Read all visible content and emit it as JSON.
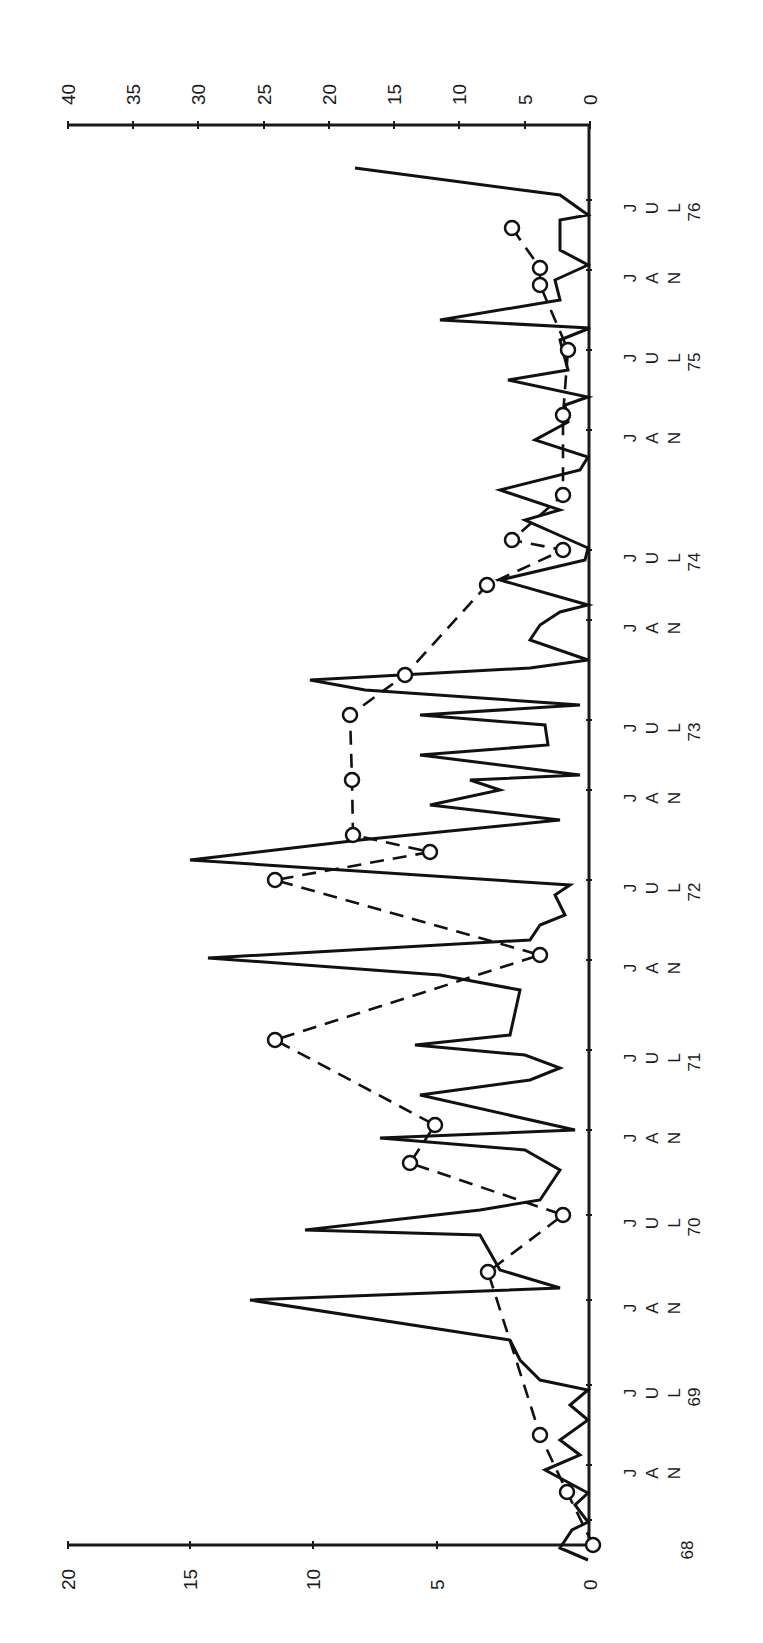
{
  "chart_data": {
    "type": "line",
    "orientation": "rotated 90 degrees clockwise (time axis vertical, values horizontal)",
    "title": "",
    "xlabel": "",
    "ylabel_left": "",
    "ylabel_right": "",
    "time_axis": {
      "ticks": [
        {
          "label": "68",
          "month": "",
          "pos": 1520
        },
        {
          "label": "JAN",
          "year": "",
          "pos": 1465
        },
        {
          "label": "JUL",
          "year": "69",
          "pos": 1385
        },
        {
          "label": "JAN",
          "year": "",
          "pos": 1300
        },
        {
          "label": "JUL",
          "year": "70",
          "pos": 1215
        },
        {
          "label": "JAN",
          "year": "",
          "pos": 1130
        },
        {
          "label": "JUL",
          "year": "71",
          "pos": 1050
        },
        {
          "label": "JAN",
          "year": "",
          "pos": 960
        },
        {
          "label": "JUL",
          "year": "72",
          "pos": 880
        },
        {
          "label": "JAN",
          "year": "",
          "pos": 790
        },
        {
          "label": "JUL",
          "year": "73",
          "pos": 720
        },
        {
          "label": "JAN",
          "year": "",
          "pos": 620
        },
        {
          "label": "JUL",
          "year": "74",
          "pos": 550
        },
        {
          "label": "JAN",
          "year": "",
          "pos": 430
        },
        {
          "label": "JUL",
          "year": "75",
          "pos": 350
        },
        {
          "label": "JAN",
          "year": "",
          "pos": 270
        },
        {
          "label": "JUL",
          "year": "76",
          "pos": 200
        }
      ]
    },
    "left_axis": {
      "range": [
        0,
        20
      ],
      "ticks": [
        "0",
        "5",
        "10",
        "15",
        "20"
      ],
      "series": "open-circle dashed"
    },
    "right_axis": {
      "range": [
        0,
        40
      ],
      "ticks": [
        "0",
        "5",
        "10",
        "15",
        "20",
        "25",
        "30",
        "35",
        "40"
      ],
      "series": "solid line"
    },
    "series": [
      {
        "name": "Solid series (right axis, 0-40)",
        "style": "solid",
        "points_xy": [
          [
            588,
            1560
          ],
          [
            560,
            1548
          ],
          [
            572,
            1530
          ],
          [
            588,
            1522
          ],
          [
            575,
            1505
          ],
          [
            588,
            1493
          ],
          [
            545,
            1470
          ],
          [
            580,
            1455
          ],
          [
            560,
            1440
          ],
          [
            588,
            1420
          ],
          [
            570,
            1405
          ],
          [
            588,
            1390
          ],
          [
            540,
            1380
          ],
          [
            520,
            1360
          ],
          [
            510,
            1340
          ],
          [
            250,
            1300
          ],
          [
            560,
            1288
          ],
          [
            500,
            1270
          ],
          [
            480,
            1235
          ],
          [
            305,
            1230
          ],
          [
            480,
            1210
          ],
          [
            540,
            1200
          ],
          [
            560,
            1170
          ],
          [
            525,
            1150
          ],
          [
            380,
            1138
          ],
          [
            575,
            1130
          ],
          [
            420,
            1095
          ],
          [
            530,
            1080
          ],
          [
            560,
            1068
          ],
          [
            525,
            1055
          ],
          [
            415,
            1045
          ],
          [
            510,
            1035
          ],
          [
            520,
            990
          ],
          [
            440,
            975
          ],
          [
            208,
            958
          ],
          [
            530,
            940
          ],
          [
            540,
            925
          ],
          [
            565,
            915
          ],
          [
            555,
            895
          ],
          [
            570,
            885
          ],
          [
            190,
            860
          ],
          [
            360,
            840
          ],
          [
            560,
            820
          ],
          [
            430,
            805
          ],
          [
            500,
            790
          ],
          [
            470,
            780
          ],
          [
            580,
            775
          ],
          [
            420,
            755
          ],
          [
            548,
            745
          ],
          [
            545,
            725
          ],
          [
            420,
            715
          ],
          [
            580,
            705
          ],
          [
            365,
            690
          ],
          [
            310,
            680
          ],
          [
            530,
            668
          ],
          [
            588,
            660
          ],
          [
            530,
            640
          ],
          [
            540,
            625
          ],
          [
            560,
            612
          ],
          [
            588,
            605
          ],
          [
            500,
            580
          ],
          [
            585,
            560
          ],
          [
            588,
            548
          ],
          [
            525,
            520
          ],
          [
            560,
            510
          ],
          [
            500,
            490
          ],
          [
            580,
            470
          ],
          [
            588,
            457
          ],
          [
            535,
            440
          ],
          [
            568,
            422
          ],
          [
            565,
            405
          ],
          [
            588,
            397
          ],
          [
            508,
            380
          ],
          [
            568,
            370
          ],
          [
            560,
            340
          ],
          [
            590,
            328
          ],
          [
            440,
            320
          ],
          [
            560,
            300
          ],
          [
            555,
            280
          ],
          [
            588,
            265
          ],
          [
            560,
            250
          ],
          [
            560,
            220
          ],
          [
            588,
            215
          ],
          [
            560,
            195
          ],
          [
            355,
            168
          ]
        ]
      },
      {
        "name": "Circle-marker series (left axis, 0-20)",
        "style": "dashed with open circle markers",
        "points_xy": [
          [
            593,
            1545
          ],
          [
            567,
            1492
          ],
          [
            540,
            1435
          ],
          [
            488,
            1272
          ],
          [
            563,
            1215
          ],
          [
            410,
            1163
          ],
          [
            435,
            1125
          ],
          [
            275,
            1040
          ],
          [
            540,
            955
          ],
          [
            275,
            880
          ],
          [
            430,
            852
          ],
          [
            353,
            835
          ],
          [
            352,
            780
          ],
          [
            350,
            715
          ],
          [
            405,
            675
          ],
          [
            487,
            585
          ],
          [
            563,
            550
          ],
          [
            512,
            540
          ],
          [
            563,
            495
          ],
          [
            563,
            415
          ],
          [
            568,
            350
          ],
          [
            540,
            285
          ],
          [
            540,
            268
          ],
          [
            512,
            228
          ]
        ]
      }
    ]
  },
  "axes": {
    "left_ticks": [
      {
        "label": "20",
        "x": 68
      },
      {
        "label": "15",
        "x": 190
      },
      {
        "label": "10",
        "x": 313
      },
      {
        "label": "5",
        "x": 437
      },
      {
        "label": "0",
        "x": 590
      }
    ],
    "right_ticks": [
      {
        "label": "40",
        "x": 68
      },
      {
        "label": "35",
        "x": 133
      },
      {
        "label": "30",
        "x": 198
      },
      {
        "label": "25",
        "x": 264
      },
      {
        "label": "20",
        "x": 329
      },
      {
        "label": "15",
        "x": 394
      },
      {
        "label": "10",
        "x": 459
      },
      {
        "label": "5",
        "x": 525
      },
      {
        "label": "0",
        "x": 590
      }
    ]
  }
}
